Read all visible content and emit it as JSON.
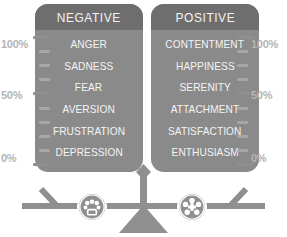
{
  "panels": [
    {
      "id": "negative",
      "header": "NEGATIVE",
      "items": [
        "ANGER",
        "SADNESS",
        "FEAR",
        "AVERSION",
        "FRUSTRATION",
        "DEPRESSION"
      ]
    },
    {
      "id": "positive",
      "header": "POSITIVE",
      "items": [
        "CONTENTMENT",
        "HAPPINESS",
        "SERENITY",
        "ATTACHMENT",
        "SATISFACTION",
        "ENTHUSIASM"
      ]
    }
  ],
  "scale_labels": {
    "left": {
      "top": "100%",
      "middle": "50%",
      "bottom": "0%"
    },
    "right": {
      "top": "100%",
      "middle": "50%",
      "bottom": "0%"
    }
  },
  "icons": {
    "negative": "sad-face-icon",
    "positive": "happy-face-icon",
    "balance": "balance-scale-icon"
  },
  "colors": {
    "panel_body": "#8a8a8a",
    "panel_header": "#6e6e6e",
    "panel_text": "#f4f4f4",
    "tick": "#9b9b9b",
    "percent_label": "#b4b4b4",
    "scale_beam": "#8f8f8f",
    "background": "#ffffff"
  }
}
